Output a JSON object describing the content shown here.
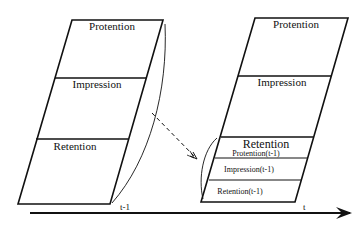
{
  "diagram": {
    "left_block": {
      "time_label": "t-1",
      "sections": [
        {
          "label": "Protention"
        },
        {
          "label": "Impression"
        },
        {
          "label": "Retention"
        }
      ]
    },
    "right_block": {
      "time_label": "t",
      "sections": [
        {
          "label": "Protention"
        },
        {
          "label": "Impression"
        },
        {
          "label": "Retention"
        }
      ],
      "retention_subsections": [
        {
          "label": "Protention(t-1)"
        },
        {
          "label": "Impression(t-1)"
        },
        {
          "label": "Retention(t-1)"
        }
      ]
    },
    "axis": {
      "label_prev": "t-1",
      "label_now": "t"
    },
    "colors": {
      "stroke": "#111111",
      "background": "#ffffff"
    }
  }
}
